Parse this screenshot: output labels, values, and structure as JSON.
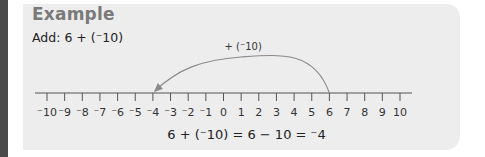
{
  "example": {
    "heading": "Example",
    "prompt": "Add: 6 + (⁻10)",
    "equation": "6 + (⁻10) = 6 − 10 = ⁻4"
  },
  "number_line": {
    "min": -10,
    "max": 10,
    "step": 1,
    "tick_labels": [
      "⁻10",
      "⁻9",
      "⁻8",
      "⁻7",
      "⁻6",
      "⁻5",
      "⁻4",
      "⁻3",
      "⁻2",
      "⁻1",
      "0",
      "1",
      "2",
      "3",
      "4",
      "5",
      "6",
      "7",
      "8",
      "9",
      "10"
    ],
    "jump": {
      "from": 6,
      "to": -4,
      "label": "+ (⁻10)"
    }
  },
  "colors": {
    "panel": "#ededed",
    "heading": "#7a7a7a",
    "line": "#555555",
    "arc": "#8a8a8a",
    "text": "#222222",
    "side_bar": "#4a4a4a"
  }
}
